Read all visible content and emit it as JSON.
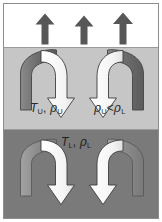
{
  "figure": {
    "width": 162,
    "height": 222,
    "frame_color": "#8d8d8d"
  },
  "bands": [
    {
      "id": "upper",
      "name": "upper-white-region",
      "fill": "#ffffff",
      "description": "white region above the upper fluid layer"
    },
    {
      "id": "middle",
      "name": "upper-fluid-layer",
      "fill": "#c6c6c6",
      "description": "light gray upper fluid layer"
    },
    {
      "id": "lower",
      "name": "lower-fluid-layer",
      "fill": "#7a7a7a",
      "description": "dark gray lower fluid layer"
    }
  ],
  "up_arrows": {
    "count": 3,
    "fill": "#575757",
    "positions_x": [
      43,
      82,
      121
    ],
    "direction": "up"
  },
  "curved_arrows": {
    "dark_fill": "#6f6f6f",
    "dark_fill_lower": "#8c8c8c",
    "light_fill": "#ffffff",
    "outline": "#3d3d3d",
    "middle_count": 2,
    "lower_count": 2,
    "direction": "overturning"
  },
  "labels": {
    "upper_state": {
      "temperature_symbol": "T",
      "temperature_subscript": "U",
      "separator": ", ",
      "density_symbol": "ρ",
      "density_subscript": "U",
      "text": "T_U, ρ_U"
    },
    "density_inequality": {
      "left_symbol": "ρ",
      "left_subscript": "U",
      "operator": "<",
      "right_symbol": "ρ",
      "right_subscript": "L",
      "text": "ρ_U < ρ_L"
    },
    "lower_state": {
      "temperature_symbol": "T",
      "temperature_subscript": "L",
      "separator": ", ",
      "density_symbol": "ρ",
      "density_subscript": "L",
      "text": "T_L, ρ_L"
    }
  }
}
